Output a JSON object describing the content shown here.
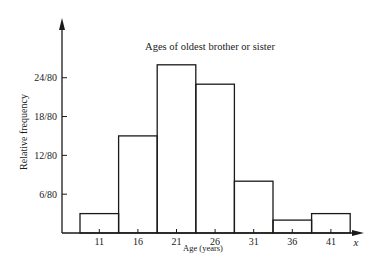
{
  "chart_data": {
    "type": "bar",
    "title": "Ages of oldest brother or sister",
    "xlabel": "Age (years)",
    "ylabel": "Relative frequency",
    "x_axis_symbol": "x",
    "categories": [
      "11",
      "16",
      "21",
      "26",
      "31",
      "36",
      "41"
    ],
    "values": [
      3,
      15,
      26,
      23,
      8,
      2,
      3
    ],
    "value_units": "count out of 80 (relative frequency = value/80)",
    "relative_frequencies": [
      "3/80",
      "15/80",
      "26/80",
      "23/80",
      "8/80",
      "2/80",
      "3/80"
    ],
    "y_ticks": [
      "6/80",
      "12/80",
      "18/80",
      "24/80"
    ],
    "y_tick_values": [
      6,
      12,
      18,
      24
    ],
    "ylim": [
      0,
      34
    ],
    "grid": false,
    "legend": null,
    "histogram": true
  }
}
